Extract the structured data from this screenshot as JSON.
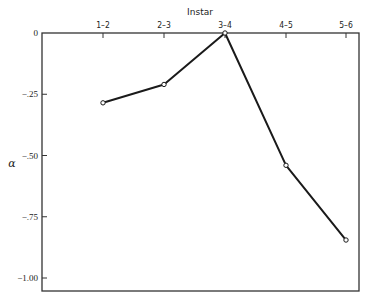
{
  "chart_data": {
    "type": "line",
    "title": "",
    "xlabel": "Instar",
    "ylabel": "α",
    "categories": [
      "1-2",
      "2-3",
      "3-4",
      "4-5",
      "5-6"
    ],
    "series": [
      {
        "name": "α",
        "values": [
          -0.285,
          -0.21,
          0.0,
          -0.54,
          -0.845
        ]
      }
    ],
    "ylim": [
      -1.05,
      0
    ],
    "yticks": [
      0,
      -0.25,
      -0.5,
      -0.75,
      -1.0
    ],
    "ytick_labels": [
      "0",
      "-.25",
      "-.50",
      "-.75",
      "-1.00"
    ],
    "x_axis_position": "top",
    "grid": false,
    "legend": null,
    "markers": "open-circle"
  },
  "colors": {
    "line": "#1a1a1a",
    "axis": "#333333",
    "background": "#ffffff"
  }
}
